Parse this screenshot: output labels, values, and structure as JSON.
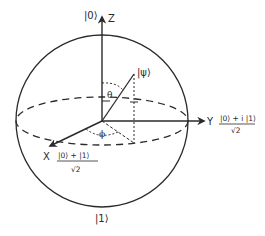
{
  "diagram": {
    "axes": {
      "z": {
        "name": "Z",
        "state": "|0⟩"
      },
      "y": {
        "name": "Y",
        "state_numerator": "|0⟩ + i |1⟩",
        "state_denominator": "√2"
      },
      "x": {
        "name": "X",
        "state_numerator": "|0⟩ + |1⟩",
        "state_denominator": "√2"
      },
      "bottom": {
        "state": "|1⟩"
      }
    },
    "state_vector": {
      "label": "|ψ⟩"
    },
    "angles": {
      "polar": "θ",
      "azimuthal": "ϕ"
    },
    "colors": {
      "line": "#2a2a2a",
      "background": "#ffffff"
    }
  }
}
